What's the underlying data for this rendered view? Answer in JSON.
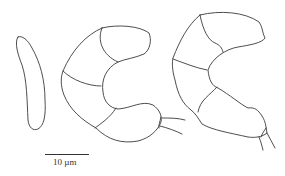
{
  "figure": {
    "specimens": [
      {
        "id": "single-cell",
        "cells": 1
      },
      {
        "id": "curved-multicellular-1",
        "cells": 5
      },
      {
        "id": "curved-multicellular-2",
        "cells": 5
      }
    ],
    "scale_bar": {
      "label": "10 µm",
      "length_px": 44
    },
    "colors": {
      "line": "#3a3a3a",
      "background": "#ffffff"
    }
  }
}
